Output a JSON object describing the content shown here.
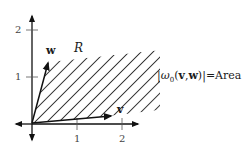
{
  "diagram": {
    "type": "vector-parallelogram-area",
    "axes": {
      "x_ticks": [
        {
          "label": "1"
        },
        {
          "label": "2"
        }
      ],
      "y_ticks": [
        {
          "label": "1"
        },
        {
          "label": "2"
        }
      ]
    },
    "vectors": {
      "v": {
        "label": "v",
        "approx_tip": [
          1.75,
          0.15
        ]
      },
      "w": {
        "label": "w",
        "approx_tip": [
          0.35,
          1.35
        ]
      }
    },
    "region": {
      "label": "R",
      "fill": "diagonal-hatch"
    },
    "equation": {
      "abs_open": "|",
      "omega": "ω",
      "subscript": "0",
      "args_open": "(",
      "arg1": "v",
      "comma": ",",
      "arg2": "w",
      "args_close": ")",
      "abs_close": "|",
      "equals": "=",
      "rhs_text": "Area of ",
      "rhs_var": "R"
    },
    "colors": {
      "line": "#111111",
      "tick": "#555555",
      "text": "#1a1a1a"
    }
  }
}
